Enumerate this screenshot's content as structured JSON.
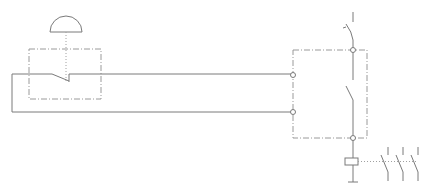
{
  "diagram": {
    "type": "electrical-schematic",
    "title": "",
    "colors": {
      "line": "#7a7a7a",
      "enclosure": "#9a9a9a",
      "background": "#ffffff"
    },
    "components": [
      {
        "id": "emergency-stop",
        "symbol": "mushroom-head-pushbutton",
        "contact": "normally-closed",
        "enclosure": "dash-dot"
      },
      {
        "id": "safety-relay",
        "symbol": "module",
        "enclosure": "dash-dot",
        "terminals": 4,
        "internal_contact": "normally-open"
      },
      {
        "id": "main-switch",
        "symbol": "circuit-breaker-contact"
      },
      {
        "id": "contactor-coil",
        "symbol": "coil"
      },
      {
        "id": "main-contacts",
        "symbol": "three-pole-normally-open",
        "poles": 3
      },
      {
        "id": "ground",
        "symbol": "ground"
      }
    ],
    "labels": []
  }
}
